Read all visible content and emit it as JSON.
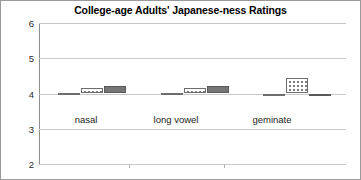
{
  "chart_data": {
    "type": "bar",
    "title": "College-age Adults' Japanese-ness Ratings",
    "xlabel": "",
    "ylabel": "",
    "ylim": [
      2,
      6
    ],
    "yticks": [
      2,
      3,
      4,
      5,
      6
    ],
    "ytick_labels": [
      "2",
      "3",
      "4",
      "5",
      "6"
    ],
    "grid": true,
    "legend": "none",
    "categories": [
      "nasal",
      "long vowel",
      "geminate"
    ],
    "series": [
      {
        "name": "hatched",
        "pattern": "diagonal-hatch",
        "values": [
          4.02,
          4.02,
          4.0
        ]
      },
      {
        "name": "dotted",
        "pattern": "dots",
        "values": [
          4.15,
          4.16,
          4.45
        ]
      },
      {
        "name": "solid",
        "pattern": "solid-gray",
        "values": [
          4.2,
          4.2,
          3.92
        ]
      }
    ]
  },
  "colors": {
    "grid": "#c9c9c9",
    "axis": "#8d8d8d",
    "solid_bar": "#767676",
    "bar_outline": "#6d6d6d",
    "border": "#9a9a9a",
    "title_text": "#000000",
    "tick_text": "#2b2b2b"
  }
}
